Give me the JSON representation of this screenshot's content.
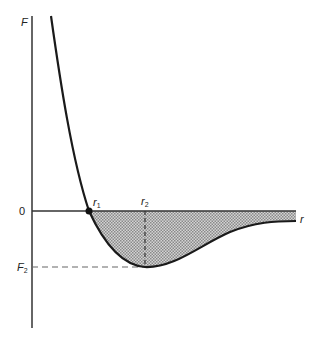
{
  "diagram": {
    "axes": {
      "y_label": "F",
      "x_label": "r",
      "zero_label": "0"
    },
    "points": {
      "r1": {
        "label": "r",
        "sub": "1",
        "description": "zero crossing (F = 0)"
      },
      "r2": {
        "label": "r",
        "sub": "2",
        "description": "location of minimum force"
      },
      "F2": {
        "label": "F",
        "sub": "2",
        "description": "minimum force value"
      }
    },
    "shaded_region": "area between curve and r-axis for r > r1 (attractive region)",
    "colors": {
      "curve": "#1a1a1a",
      "axis": "#333333",
      "fill": "#b8b8b8",
      "dashed": "#555555"
    }
  }
}
